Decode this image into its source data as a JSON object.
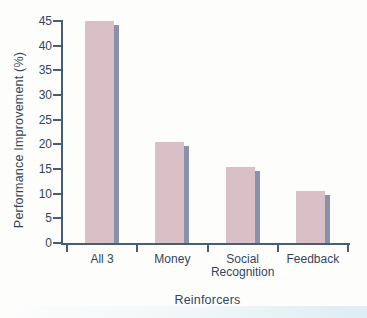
{
  "chart_data": {
    "type": "bar",
    "title": "",
    "xlabel": "Reinforcers",
    "ylabel": "Performance Improvement (%)",
    "categories": [
      "All 3",
      "Money",
      "Social Recognition",
      "Feedback"
    ],
    "category_lines": [
      [
        "All 3"
      ],
      [
        "Money"
      ],
      [
        "Social",
        "Recognition"
      ],
      [
        "Feedback"
      ]
    ],
    "values": [
      45,
      20.5,
      15.5,
      10.5
    ],
    "ylim": [
      0,
      45
    ],
    "yticks": [
      0,
      5,
      10,
      15,
      20,
      25,
      30,
      35,
      40,
      45
    ],
    "grid": false,
    "legend_position": "none",
    "bar_color": "#d9c0c7",
    "bar_shadow_color": "#8891aa",
    "axis_color": "#475d74",
    "text_color": "#33465e"
  }
}
